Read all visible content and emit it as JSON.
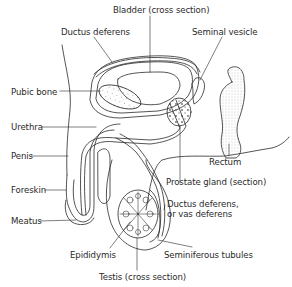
{
  "figure": {
    "labels": {
      "bladder": "Bladder (cross section)",
      "ductus_deferens_top": "Ductus deferens",
      "seminal_vesicle": "Seminal vesicle",
      "pubic_bone": "Pubic bone",
      "urethra": "Urethra",
      "penis": "Penis",
      "foreskin": "Foreskin",
      "meatus": "Meatus",
      "rectum": "Rectum",
      "prostate": "Prostate gland (section)",
      "ductus_deferens_line1": "Ductus deferens,",
      "ductus_deferens_line2": "or vas deferens",
      "epididymis": "Epididymis",
      "seminiferous_tubules": "Seminiferous tubules",
      "testis": "Testis (cross section)"
    },
    "colors": {
      "ink": "#2a2a2a",
      "background": "#ffffff",
      "shading": "#8a8a8a"
    }
  }
}
